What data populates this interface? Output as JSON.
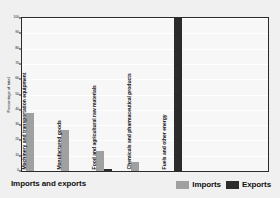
{
  "chart_data": {
    "type": "bar",
    "title": "Imports and exports",
    "xlabel": "",
    "ylabel": "Percentage of total",
    "ylim": [
      0,
      100
    ],
    "yticks": [
      0,
      10,
      20,
      30,
      40,
      50,
      60,
      70,
      80,
      90,
      100
    ],
    "grid": true,
    "legend_position": "bottom-right",
    "categories": [
      "Machinery and transportation equipment",
      "Manufactured goods",
      "Food and agricultural raw materials",
      "Chemicals and pharmaceutical products",
      "Fuels and other energy"
    ],
    "series": [
      {
        "name": "Imports",
        "color": "#a0a0a0",
        "values": [
          38,
          27,
          13,
          6,
          0
        ]
      },
      {
        "name": "Exports",
        "color": "#2b2b2b",
        "values": [
          0,
          0,
          1,
          0,
          100
        ]
      }
    ]
  },
  "legend": {
    "items": [
      {
        "label": "Imports",
        "color": "#a0a0a0"
      },
      {
        "label": "Exports",
        "color": "#2b2b2b"
      }
    ]
  }
}
